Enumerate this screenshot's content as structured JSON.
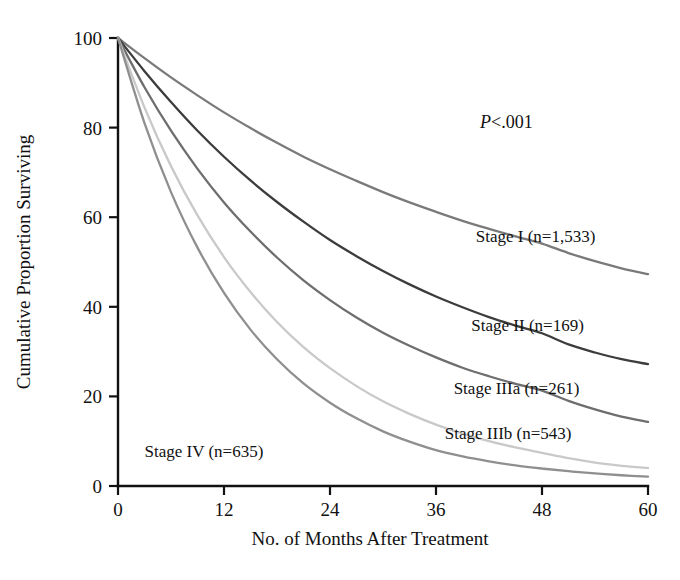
{
  "chart_data": {
    "type": "line",
    "title": "",
    "subtitle": "",
    "xlabel": "No. of Months After Treatment",
    "ylabel": "Cumulative Proportion Surviving",
    "xlim": [
      0,
      60
    ],
    "ylim": [
      0,
      100
    ],
    "xticks": [
      0,
      12,
      24,
      36,
      48,
      60
    ],
    "xticklabels": [
      "0",
      "12",
      "24",
      "36",
      "48",
      "60"
    ],
    "yticks": [
      0,
      20,
      40,
      60,
      80,
      100
    ],
    "yticklabels": [
      "0",
      "20",
      "40",
      "60",
      "80",
      "100"
    ],
    "grid": false,
    "legend_position": "inline-right",
    "annotations": [
      {
        "name": "p-value",
        "text_prefix": "P",
        "text_rest": "<.001",
        "x": 40,
        "y": 84
      }
    ],
    "x": [
      0,
      3,
      6,
      9,
      12,
      15,
      18,
      21,
      24,
      27,
      30,
      33,
      36,
      39,
      42,
      45,
      48,
      51,
      54,
      57,
      60
    ],
    "series": [
      {
        "name": "Stage I",
        "label": "Stage I (n=1,533)",
        "n": 1533,
        "color": "#7a7a7a",
        "label_x": 40.5,
        "label_y": 54.5,
        "values": [
          100,
          95.5,
          91.2,
          87.2,
          83.4,
          79.9,
          76.6,
          73.5,
          70.7,
          68.1,
          65.6,
          63.3,
          61.2,
          59.2,
          57.4,
          55.7,
          54.1,
          52.0,
          50.2,
          48.6,
          47.3
        ]
      },
      {
        "name": "Stage II",
        "label": "Stage II (n=169)",
        "n": 169,
        "color": "#3c3c3c",
        "label_x": 40.0,
        "label_y": 34.5,
        "values": [
          100,
          92.6,
          85.7,
          79.3,
          73.5,
          68.2,
          63.4,
          59.0,
          54.9,
          51.3,
          48.0,
          45.0,
          42.3,
          39.9,
          37.7,
          35.8,
          34.1,
          31.6,
          29.8,
          28.3,
          27.2
        ]
      },
      {
        "name": "Stage IIIa",
        "label": "Stage IIIa (n=261)",
        "n": 261,
        "color": "#6e6e6e",
        "label_x": 38.0,
        "label_y": 20.5,
        "values": [
          100,
          89.0,
          79.3,
          70.8,
          63.3,
          56.8,
          51.0,
          45.9,
          41.5,
          37.6,
          34.2,
          31.3,
          28.7,
          26.4,
          24.5,
          22.8,
          21.3,
          19.0,
          17.1,
          15.5,
          14.3
        ]
      },
      {
        "name": "Stage IIIb",
        "label": "Stage IIIb (n=543)",
        "n": 543,
        "color": "#c9c9c9",
        "label_x": 37.0,
        "label_y": 10.5,
        "values": [
          100,
          84.5,
          71.4,
          60.4,
          51.1,
          43.3,
          36.6,
          31.0,
          26.3,
          22.3,
          18.9,
          16.1,
          13.7,
          11.7,
          10.0,
          8.6,
          7.4,
          6.2,
          5.2,
          4.5,
          4.0
        ]
      },
      {
        "name": "Stage IV",
        "label": "Stage IV (n=635)",
        "n": 635,
        "color": "#8f8f8f",
        "label_x": 3.0,
        "label_y": 6.5,
        "values": [
          100,
          81.0,
          65.6,
          53.2,
          43.1,
          34.9,
          28.3,
          22.9,
          18.6,
          15.1,
          12.2,
          9.9,
          8.0,
          6.6,
          5.5,
          4.6,
          3.9,
          3.3,
          2.8,
          2.4,
          2.1
        ]
      }
    ]
  }
}
